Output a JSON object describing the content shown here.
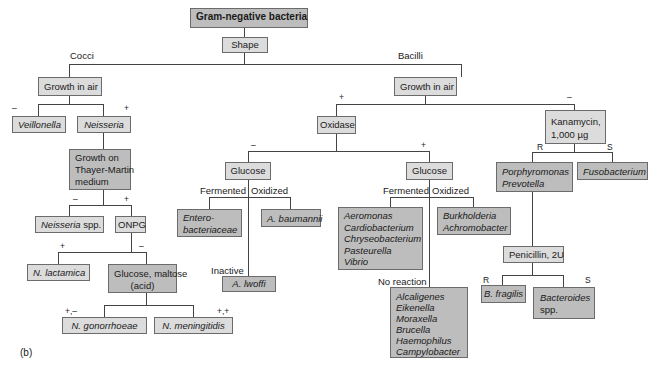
{
  "figure_label": "(b)",
  "root": "Gram-negative bacteria",
  "shape_test": "Shape",
  "branches": {
    "cocci": "Cocci",
    "bacilli": "Bacilli"
  },
  "cocci": {
    "growth_in_air": "Growth in air",
    "neg_sign": "–",
    "pos_sign": "+",
    "veillonella": "Veillonella",
    "neisseria": "Neisseria",
    "thayer_martin": [
      "Growth on",
      "Thayer-Martin",
      "medium"
    ],
    "tm_neg": "–",
    "tm_pos": "+",
    "neisseria_spp": [
      "Neisseria",
      " spp."
    ],
    "onpg": "ONPG",
    "onpg_pos": "+",
    "onpg_neg": "–",
    "n_lactamica": "N. lactamica",
    "glucose_maltose": [
      "Glucose, maltose",
      "(acid)"
    ],
    "gm_left": "+,–",
    "gm_right": "+,+",
    "n_gonorrhoeae": "N. gonorrhoeae",
    "n_meningitidis": "N. meningitidis"
  },
  "bacilli": {
    "growth_in_air": "Growth in air",
    "pos_sign": "+",
    "neg_sign": "–",
    "oxidase": "Oxidase",
    "oxidase_neg": "–",
    "oxidase_pos": "+",
    "kanamycin": [
      "Kanamycin,",
      "1,000 µg"
    ],
    "kan_r": "R",
    "kan_s": "S",
    "glucose_left": "Glucose",
    "glucose_right": "Glucose",
    "fermented": "Fermented",
    "oxidized": "Oxidized",
    "inactive": "Inactive",
    "no_reaction": "No reaction",
    "enterobacteriaceae": [
      "Entero-",
      "bacteriaceae"
    ],
    "a_baumannii": "A. baumannii",
    "a_lwoffi": "A. lwoffi",
    "fermenters_group": [
      "Aeromonas",
      "Cardiobacterium",
      "Chryseobacterium",
      "Pasteurella",
      "Vibrio"
    ],
    "oxidizers_group": [
      "Burkholderia",
      "Achromobacter"
    ],
    "no_reaction_group": [
      "Alcaligenes",
      "Eikenella",
      "Moraxella",
      "Brucella",
      "Haemophilus",
      "Campylobacter"
    ],
    "porphyromonas_prevotella": [
      "Porphyromonas",
      "Prevotella"
    ],
    "fusobacterium": "Fusobacterium",
    "penicillin": "Penicillin, 2U",
    "pen_r": "R",
    "pen_s": "S",
    "b_fragilis": "B. fragilis",
    "bacteroides_spp": [
      "Bacteroides",
      "spp."
    ]
  }
}
